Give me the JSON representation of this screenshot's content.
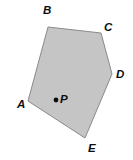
{
  "figure": {
    "type": "geometry-diagram",
    "background_color": "#ffffff",
    "polygon": {
      "name": "pentagon-abcde",
      "fill_color": "#c5c5c5",
      "stroke_color": "#8a8a8a",
      "stroke_width": 1,
      "points": "48,27 101,33 112,74 85,138 28,101",
      "vertices": [
        {
          "label": "A",
          "x": 28,
          "y": 101,
          "label_x": 17,
          "label_y": 98
        },
        {
          "label": "B",
          "x": 48,
          "y": 27,
          "label_x": 43,
          "label_y": 4
        },
        {
          "label": "C",
          "x": 101,
          "y": 33,
          "label_x": 104,
          "label_y": 21
        },
        {
          "label": "D",
          "x": 112,
          "y": 74,
          "label_x": 116,
          "label_y": 68
        },
        {
          "label": "E",
          "x": 85,
          "y": 138,
          "label_x": 88,
          "label_y": 142
        }
      ]
    },
    "interior_point": {
      "label": "P",
      "x": 56,
      "y": 100,
      "dot_radius": 2.4,
      "dot_color": "#0d0d0d",
      "label_x": 60,
      "label_y": 93
    }
  }
}
